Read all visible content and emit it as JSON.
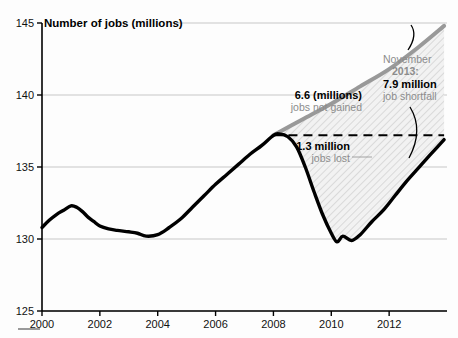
{
  "chart_data": {
    "type": "line",
    "title": "Number of jobs (millions)",
    "xlabel": "",
    "ylabel": "Number of jobs (millions)",
    "xlim": [
      2000,
      2014
    ],
    "ylim": [
      125,
      145
    ],
    "grid": true,
    "legend_position": "none",
    "yticks": [
      125,
      130,
      135,
      140,
      145
    ],
    "xticks": [
      2000,
      2002,
      2004,
      2006,
      2008,
      2010,
      2012
    ],
    "series": [
      {
        "name": "Actual jobs",
        "color": "#000000",
        "x": [
          2000.0,
          2000.25,
          2000.5,
          2000.75,
          2001.0,
          2001.2,
          2001.4,
          2001.6,
          2001.8,
          2002.0,
          2002.3,
          2002.6,
          2003.0,
          2003.3,
          2003.6,
          2004.0,
          2004.4,
          2004.8,
          2005.2,
          2005.6,
          2006.0,
          2006.4,
          2006.8,
          2007.2,
          2007.6,
          2008.0,
          2008.2,
          2008.5,
          2008.8,
          2009.1,
          2009.4,
          2009.7,
          2010.0,
          2010.2,
          2010.4,
          2010.7,
          2011.0,
          2011.4,
          2011.8,
          2012.2,
          2012.6,
          2013.0,
          2013.4,
          2013.9
        ],
        "values": [
          130.8,
          131.3,
          131.7,
          132.0,
          132.3,
          132.2,
          131.9,
          131.5,
          131.2,
          130.9,
          130.7,
          130.6,
          130.5,
          130.4,
          130.2,
          130.3,
          130.8,
          131.4,
          132.2,
          133.0,
          133.8,
          134.5,
          135.2,
          135.9,
          136.5,
          137.2,
          137.3,
          137.1,
          136.4,
          135.0,
          133.3,
          131.7,
          130.4,
          129.8,
          130.2,
          129.9,
          130.3,
          131.2,
          132.0,
          133.0,
          134.0,
          134.9,
          135.8,
          136.9
        ]
      },
      {
        "name": "Pre-recession trend",
        "color": "#999999",
        "x": [
          2008.0,
          2009.0,
          2010.0,
          2011.0,
          2012.0,
          2013.0,
          2013.9
        ],
        "values": [
          137.2,
          138.3,
          139.4,
          140.6,
          141.8,
          143.3,
          144.8
        ]
      }
    ],
    "reference_line": {
      "name": "pre-recession-peak",
      "value": 137.2,
      "style": "dashed",
      "x_start": 2008.0,
      "x_end": 2013.9
    },
    "shaded_regions": [
      {
        "name": "jobs-not-gained",
        "style": "hatched"
      },
      {
        "name": "jobs-lost",
        "style": "hatched"
      }
    ],
    "annotations": [
      {
        "name": "jobs-not-gained",
        "bold_text": "6.6 (millions)",
        "gray_text": "jobs not gained"
      },
      {
        "name": "jobs-lost",
        "bold_text": "1.3 million",
        "gray_text": "jobs lost"
      },
      {
        "name": "job-shortfall",
        "line1": "November",
        "line2": "2013:",
        "line3": "7.9 million",
        "line4": "job shortfall"
      }
    ]
  },
  "colors": {
    "actual_line": "#000000",
    "trend_line": "#999999",
    "gray_text": "#8c8c8c",
    "grid": "#b9b9b9",
    "axis": "#000000",
    "background": "#fdfdfd"
  }
}
